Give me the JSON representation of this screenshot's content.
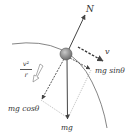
{
  "diagram": {
    "type": "free-body diagram",
    "object": "ball on curved surface",
    "labels": {
      "normal_force": "N",
      "velocity": "v",
      "tangential_component": "mg sinθ",
      "radial_component": "mg cosθ",
      "weight": "mg",
      "centripetal_numerator": "v²",
      "centripetal_denominator": "r"
    },
    "colors": {
      "line": "#555555",
      "ball": "#8a8a8a",
      "text": "#333333",
      "background": "#ffffff"
    }
  }
}
